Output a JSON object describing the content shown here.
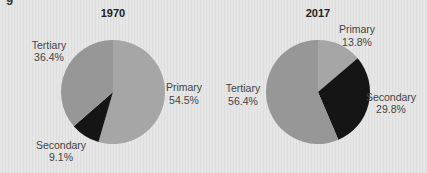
{
  "header": {
    "cut_title": "g                                                     "
  },
  "chart_data": [
    {
      "type": "pie",
      "title": "1970",
      "categories": [
        "Primary",
        "Secondary",
        "Tertiary"
      ],
      "values": [
        54.5,
        9.1,
        36.4
      ],
      "labels": [
        "54.5%",
        "9.1%",
        "36.4%"
      ],
      "colors": [
        "#a6a6a6",
        "#151515",
        "#979797"
      ]
    },
    {
      "type": "pie",
      "title": "2017",
      "categories": [
        "Primary",
        "Secondary",
        "Tertiary"
      ],
      "values": [
        13.8,
        29.8,
        56.4
      ],
      "labels": [
        "13.8%",
        "29.8%",
        "56.4%"
      ],
      "colors": [
        "#a6a6a6",
        "#151515",
        "#979797"
      ]
    }
  ]
}
